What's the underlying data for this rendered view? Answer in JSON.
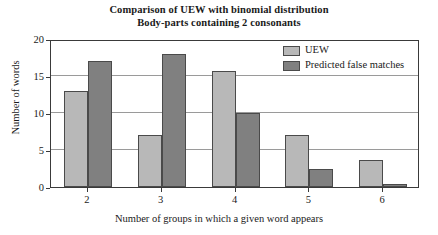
{
  "chart_data": {
    "type": "bar",
    "title": "Comparison of UEW with binomial distribution",
    "subtitle": "Body-parts containing 2 consonants",
    "xlabel": "Number of groups in which a given word appears",
    "ylabel": "Number of words",
    "categories": [
      "2",
      "3",
      "4",
      "5",
      "6"
    ],
    "series": [
      {
        "name": "UEW",
        "color": "#b8b8b8",
        "values": [
          13,
          7,
          15.7,
          7,
          3.7
        ]
      },
      {
        "name": "Predicted false matches",
        "color": "#808080",
        "values": [
          17,
          18,
          10,
          2.4,
          0.4
        ]
      }
    ],
    "ylim": [
      0,
      20
    ],
    "yticks": [
      0,
      5,
      10,
      15,
      20
    ],
    "ytick_labels": [
      "0",
      "5",
      "10",
      "15",
      "20"
    ],
    "grid": true,
    "legend_position": "top-right"
  },
  "legend": {
    "entries": [
      {
        "label": "UEW"
      },
      {
        "label": "Predicted false matches"
      }
    ]
  }
}
